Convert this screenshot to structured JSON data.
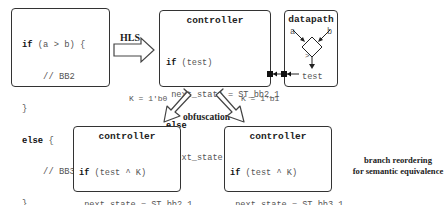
{
  "source_code": {
    "lines": [
      {
        "kw": "if",
        "rest": " (a > b) {"
      },
      {
        "kw": "",
        "rest": "    // BB2"
      },
      {
        "kw": "",
        "rest": "}"
      },
      {
        "kw": "else",
        "rest": " {"
      },
      {
        "kw": "",
        "rest": "    // BB3"
      },
      {
        "kw": "",
        "rest": "}"
      }
    ]
  },
  "hls_label": "HLS",
  "controller_top": {
    "title": "controller",
    "line1_kw": "if",
    "line1_rest": " (test)",
    "line2": " next_state = ST_bb2_1",
    "line3_kw": "else",
    "line4": " next_state = ST_bb3_1"
  },
  "datapath": {
    "title": "datapath",
    "input_a": "a",
    "input_b": "b",
    "comparator": ">",
    "output": "test"
  },
  "key_left": "K = 1'b0",
  "key_right": "K = 1'b1",
  "obfuscation_label": "obfuscation",
  "controller_left": {
    "title": "controller",
    "line1_kw": "if",
    "line1_rest": " (test ^ K)",
    "line2": " next_state = ST_bb2_1",
    "line3_kw": "else",
    "line4": " next_state = ST_bb3_1"
  },
  "controller_right": {
    "title": "controller",
    "line1_kw": "if",
    "line1_rest": " (test ^ K)",
    "line2": " next_state = ST_bb3_1",
    "line3_kw": "else",
    "line4": " next_state = ST_bb2_1"
  },
  "caption": {
    "line1": "branch reordering",
    "line2": "for semantic equivalence"
  }
}
